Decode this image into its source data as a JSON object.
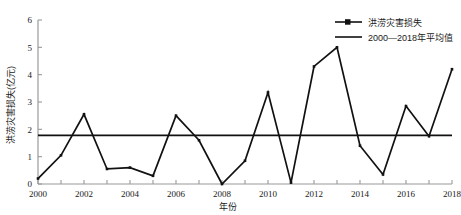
{
  "chart_data": {
    "type": "line",
    "title": "",
    "xlabel": "年份",
    "ylabel": "洪涝灾害损失(亿元)",
    "x": [
      2000,
      2001,
      2002,
      2003,
      2004,
      2005,
      2006,
      2007,
      2008,
      2009,
      2010,
      2011,
      2012,
      2013,
      2014,
      2015,
      2016,
      2017,
      2018
    ],
    "categories": [
      "2000",
      "2001",
      "2002",
      "2003",
      "2004",
      "2005",
      "2006",
      "2007",
      "2008",
      "2009",
      "2010",
      "2011",
      "2012",
      "2013",
      "2014",
      "2015",
      "2016",
      "2017",
      "2018"
    ],
    "series": [
      {
        "name": "洪涝灾害损失",
        "values": [
          0.2,
          1.05,
          2.55,
          0.55,
          0.6,
          0.3,
          2.5,
          1.6,
          0.0,
          0.85,
          3.35,
          0.05,
          4.3,
          5.0,
          1.4,
          0.35,
          2.85,
          1.75,
          4.2
        ],
        "color": "#111111",
        "marker": "square"
      },
      {
        "name": "2000—2018年平均值",
        "type": "hline",
        "value": 1.78,
        "color": "#111111",
        "marker": "none"
      }
    ],
    "xlim": [
      2000,
      2018
    ],
    "ylim": [
      0,
      6
    ],
    "yticks": [
      0,
      1,
      2,
      3,
      4,
      5,
      6
    ],
    "xticks": [
      2000,
      2002,
      2004,
      2006,
      2008,
      2010,
      2012,
      2014,
      2016,
      2018
    ],
    "xtick_minor": [
      2001,
      2003,
      2005,
      2007,
      2009,
      2011,
      2013,
      2015,
      2017
    ],
    "grid": false,
    "legend_position": "top-right",
    "axis_color": "#9a9a9a",
    "text_color": "#1a1a1a"
  },
  "legend": {
    "items": [
      {
        "label": "洪涝灾害损失"
      },
      {
        "label": "2000—2018年平均值"
      }
    ]
  },
  "axes": {
    "x_title": "年份",
    "y_title": "洪涝灾害损失(亿元)"
  }
}
